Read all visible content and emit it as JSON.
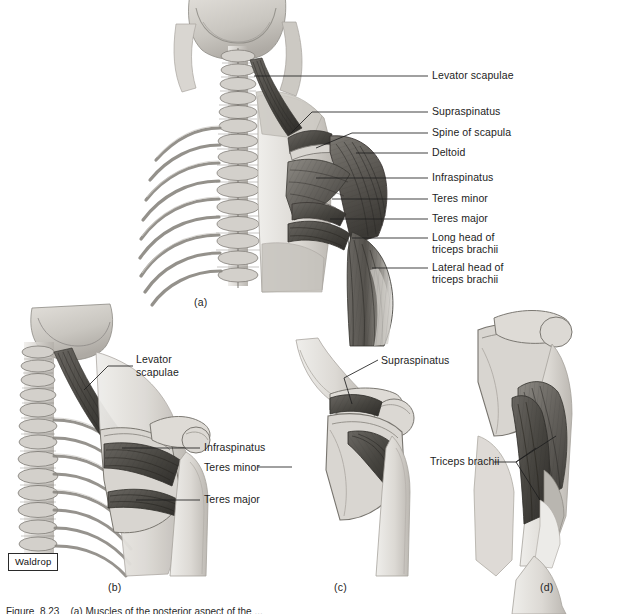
{
  "figure": {
    "background_color": "#ffffff",
    "illustrator_signature": "Waldrop",
    "caption_partial": "Figure  8.23    (a) Muscles of the posterior aspect of the ..."
  },
  "panels": [
    {
      "id": "a",
      "letter": "(a)",
      "view": "Posterior view of neck, thoracic spine and right shoulder musculature",
      "labels": [
        {
          "name": "Levator scapulae",
          "lines": [
            "Levator scapulae"
          ]
        },
        {
          "name": "Supraspinatus",
          "lines": [
            "Supraspinatus"
          ]
        },
        {
          "name": "Spine of scapula",
          "lines": [
            "Spine of scapula"
          ]
        },
        {
          "name": "Deltoid",
          "lines": [
            "Deltoid"
          ]
        },
        {
          "name": "Infraspinatus",
          "lines": [
            "Infraspinatus"
          ]
        },
        {
          "name": "Teres minor",
          "lines": [
            "Teres minor"
          ]
        },
        {
          "name": "Teres major",
          "lines": [
            "Teres major"
          ]
        },
        {
          "name": "Long head of triceps brachii",
          "lines": [
            "Long head of",
            "triceps brachii"
          ]
        },
        {
          "name": "Lateral head of triceps brachii",
          "lines": [
            "Lateral head of",
            "triceps brachii"
          ]
        }
      ]
    },
    {
      "id": "b",
      "letter": "(b)",
      "view": "Deeper posterior dissection of neck, ribs and scapula",
      "labels": [
        {
          "name": "Levator scapulae",
          "lines": [
            "Levator",
            "scapulae"
          ]
        },
        {
          "name": "Infraspinatus",
          "lines": [
            "Infraspinatus"
          ]
        },
        {
          "name": "Teres minor",
          "lines": [
            "Teres minor"
          ]
        },
        {
          "name": "Teres major",
          "lines": [
            "Teres major"
          ]
        }
      ]
    },
    {
      "id": "c",
      "letter": "(c)",
      "view": "Isolated scapula and proximal humerus, posterior aspect",
      "labels": [
        {
          "name": "Supraspinatus",
          "lines": [
            "Supraspinatus"
          ]
        }
      ]
    },
    {
      "id": "d",
      "letter": "(d)",
      "view": "Posterior arm showing the three heads of triceps brachii",
      "labels": [
        {
          "name": "Triceps brachii",
          "lines": [
            "Triceps brachii"
          ]
        }
      ]
    }
  ],
  "label_text": {
    "a_levator_scapulae": "Levator scapulae",
    "a_supraspinatus": "Supraspinatus",
    "a_spine_of_scapula": "Spine of scapula",
    "a_deltoid": "Deltoid",
    "a_infraspinatus": "Infraspinatus",
    "a_teres_minor": "Teres minor",
    "a_teres_major": "Teres major",
    "a_long_head_l1": "Long head of",
    "a_long_head_l2": "triceps brachii",
    "a_lateral_head_l1": "Lateral head of",
    "a_lateral_head_l2": "triceps brachii",
    "b_levator_l1": "Levator",
    "b_levator_l2": "scapulae",
    "b_infraspinatus": "Infraspinatus",
    "b_teres_minor": "Teres minor",
    "b_teres_major": "Teres major",
    "c_supraspinatus": "Supraspinatus",
    "d_triceps_brachii": "Triceps brachii"
  },
  "panel_letters": {
    "a": "(a)",
    "b": "(b)",
    "c": "(c)",
    "d": "(d)"
  },
  "colors": {
    "leader_line": "#1f1f1f",
    "bone_light": "#dcd9d4",
    "bone_mid": "#c2bfb9",
    "bone_shadow": "#a8a49d",
    "skin_light": "#e6e3de",
    "skin_mid": "#cfccc6",
    "muscle_light": "#9a9790",
    "muscle_mid": "#6f6c66",
    "muscle_dark": "#4a4743",
    "muscle_darkest": "#35332f",
    "outline": "#4a4843"
  }
}
